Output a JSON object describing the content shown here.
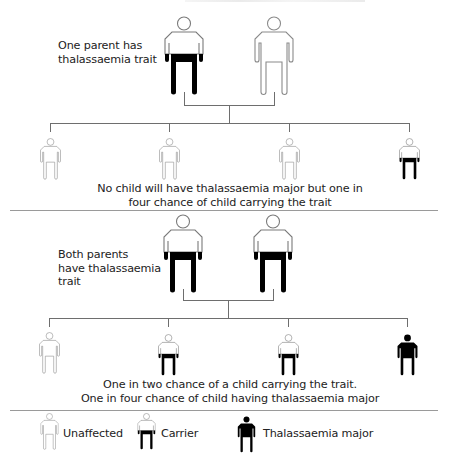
{
  "section1": {
    "label": [
      "One parent has",
      "thalassaemia trait"
    ],
    "parents": [
      "carrier",
      "unaffected"
    ],
    "children": [
      "unaffected",
      "unaffected",
      "unaffected",
      "carrier"
    ],
    "caption": [
      "No child will have thalassaemia major but one in",
      "four chance of child carrying the trait"
    ]
  },
  "section2": {
    "label": [
      "Both parents",
      "have thalassaemia",
      "trait"
    ],
    "parents": [
      "carrier",
      "carrier"
    ],
    "children": [
      "unaffected",
      "carrier",
      "carrier",
      "major"
    ],
    "caption": [
      "One in two chance of a child carrying the trait.",
      "One in four chance of child having thalassaemia major"
    ]
  },
  "legend": {
    "items": [
      {
        "type": "unaffected",
        "label": "Unaffected"
      },
      {
        "type": "carrier",
        "label": "Carrier"
      },
      {
        "type": "major",
        "label": "Thalassaemia major"
      }
    ]
  },
  "colors": {
    "outline": "#7a7a7a",
    "fill_dark": "#000000",
    "line": "#6e6e6e",
    "divider": "#9a9a9a"
  }
}
